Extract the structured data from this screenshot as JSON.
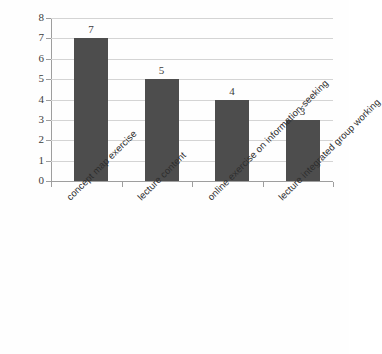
{
  "chart_data": {
    "type": "bar",
    "title": "",
    "subtitle": "",
    "xlabel": "",
    "ylabel": "",
    "categories": [
      "concept map exercise",
      "lecture content",
      "online exercise on information-seeking",
      "lecture integrated group working"
    ],
    "values": [
      7,
      5,
      4,
      3
    ],
    "value_labels": [
      "7",
      "5",
      "4",
      "3"
    ],
    "ylim": [
      0,
      8
    ],
    "ytick_labels": [
      "8",
      "7",
      "6",
      "5",
      "4",
      "3",
      "2",
      "1",
      "0"
    ],
    "ytick_values": [
      8,
      7,
      6,
      5,
      4,
      3,
      2,
      1,
      0
    ],
    "grid": true,
    "grid_axis": "y",
    "legend": false,
    "legend_position": "none",
    "series": [
      {
        "name": "",
        "values": [
          7,
          5,
          4,
          3
        ]
      }
    ],
    "colors": {
      "bar": "#4d4d4d",
      "gridline": "#d4d4d4",
      "axis": "#9e9e9e",
      "text": "#2e2e2e",
      "background": "#fefefe"
    },
    "label_rotation_degrees": -45
  }
}
